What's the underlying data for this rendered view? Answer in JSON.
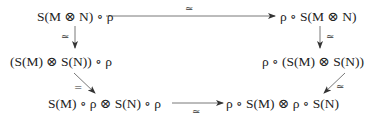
{
  "diagram": {
    "type": "commutative-diagram",
    "nodes": {
      "top_left": {
        "label": "S(M ⊗ N) ∘ ρ"
      },
      "top_right": {
        "label": "ρ ∘ S(M ⊗ N)"
      },
      "mid_left": {
        "label": "(S(M) ⊗ S(N)) ∘ ρ"
      },
      "mid_right": {
        "label": "ρ ∘ (S(M) ⊗ S(N))"
      },
      "bottom_left": {
        "label": "S(M) ∘ ρ ⊗ S(N) ∘ ρ"
      },
      "bottom_right": {
        "label": "ρ ∘ S(M) ⊗ ρ ∘ S(N)"
      }
    },
    "edges": [
      {
        "from": "top_left",
        "to": "top_right",
        "label": "≃"
      },
      {
        "from": "top_left",
        "to": "mid_left",
        "label": "≃"
      },
      {
        "from": "top_right",
        "to": "mid_right",
        "label": "≃"
      },
      {
        "from": "mid_left",
        "to": "bottom_left",
        "label": "="
      },
      {
        "from": "mid_right",
        "to": "bottom_right",
        "label": "≃"
      },
      {
        "from": "bottom_left",
        "to": "bottom_right",
        "label": "≃"
      }
    ]
  }
}
